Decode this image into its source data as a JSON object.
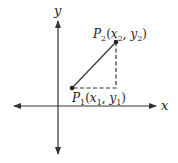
{
  "diagram": {
    "x_axis_label": "x",
    "y_axis_label": "y",
    "points": [
      {
        "name": "P",
        "sub": "1",
        "x": "x",
        "xsub": "1",
        "y": "y",
        "ysub": "1"
      },
      {
        "name": "P",
        "sub": "2",
        "x": "x",
        "xsub": "2",
        "y": "y",
        "ysub": "2"
      }
    ],
    "colors": {
      "line": "#333333",
      "background": "#ffffff"
    }
  }
}
